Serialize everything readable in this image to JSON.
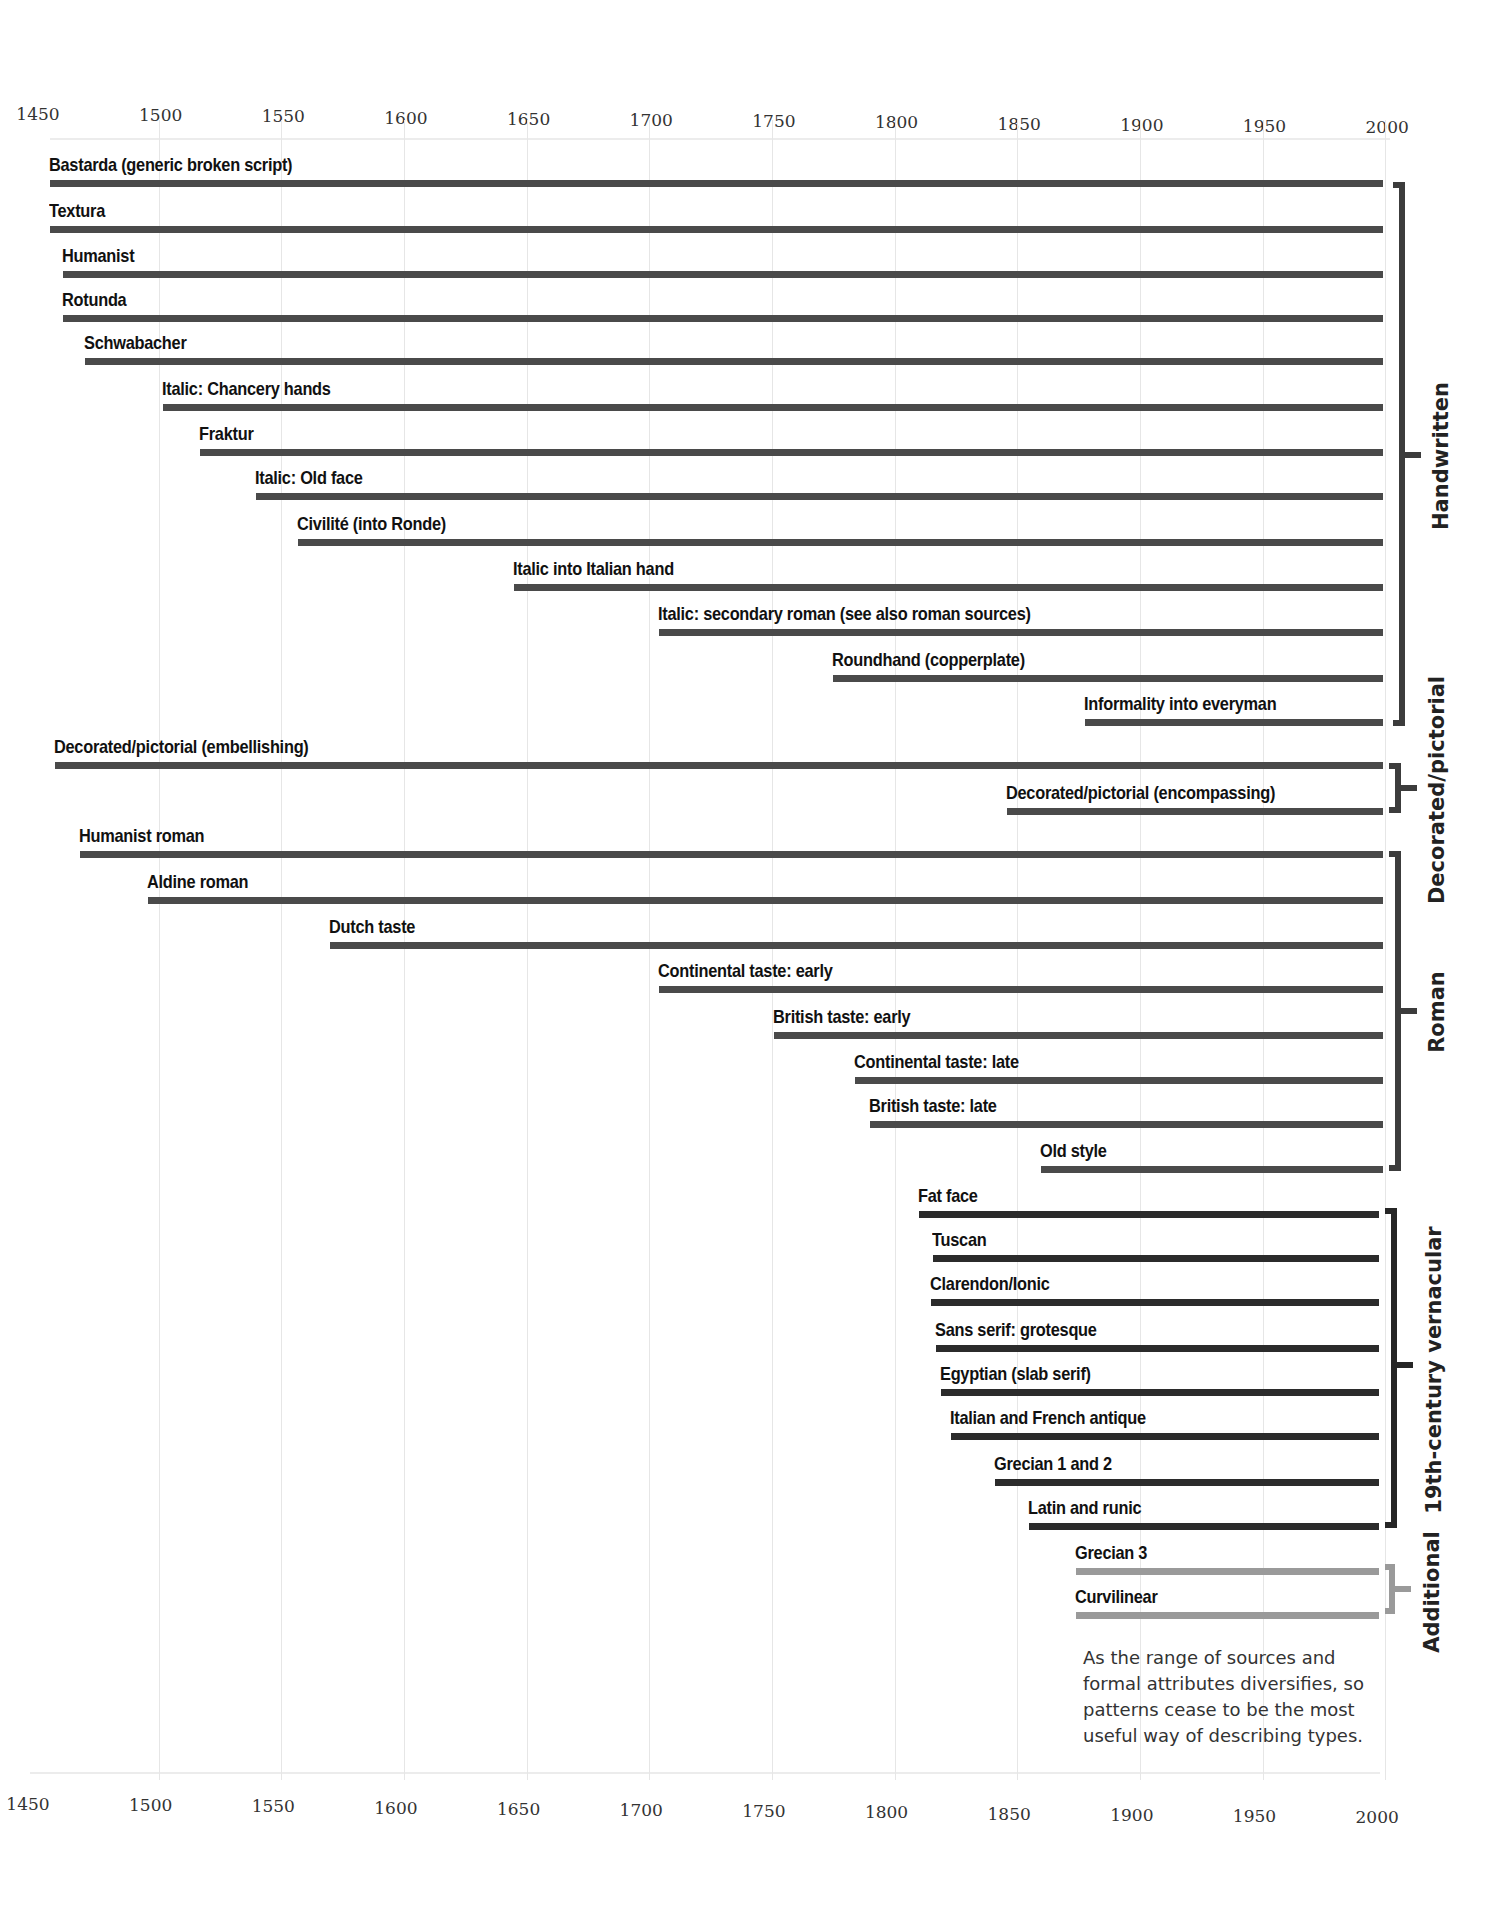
{
  "chart_data": {
    "type": "bar",
    "subtype": "timeline (horizontal range bars)",
    "title": "",
    "xlabel": "",
    "ylabel": "",
    "xlim": [
      1450,
      2000
    ],
    "x_ticks": [
      1450,
      1500,
      1550,
      1600,
      1650,
      1700,
      1750,
      1800,
      1850,
      1900,
      1950,
      2000
    ],
    "grid": true,
    "axis_position": "top and bottom",
    "groups": [
      {
        "name": "Handwritten",
        "color": "#4a4a4a",
        "items": [
          {
            "label": "Bastarda (generic broken script)",
            "start": 1455,
            "end": 2000
          },
          {
            "label": "Textura",
            "start": 1455,
            "end": 2000
          },
          {
            "label": "Humanist",
            "start": 1460,
            "end": 2000
          },
          {
            "label": "Rotunda",
            "start": 1460,
            "end": 2000
          },
          {
            "label": "Schwabacher",
            "start": 1469,
            "end": 2000
          },
          {
            "label": "Italic: Chancery hands",
            "start": 1501,
            "end": 2000
          },
          {
            "label": "Fraktur",
            "start": 1516,
            "end": 2000
          },
          {
            "label": "Italic: Old face",
            "start": 1539,
            "end": 2000
          },
          {
            "label": "Civilité (into Ronde)",
            "start": 1556,
            "end": 2000
          },
          {
            "label": "Italic into Italian hand",
            "start": 1644,
            "end": 2000
          },
          {
            "label": "Italic: secondary roman (see also roman sources)",
            "start": 1703,
            "end": 2000
          },
          {
            "label": "Roundhand (copperplate)",
            "start": 1774,
            "end": 2000
          },
          {
            "label": "Informality into everyman",
            "start": 1877,
            "end": 2000
          }
        ]
      },
      {
        "name": "Decorated/pictorial",
        "color": "#4a4a4a",
        "items": [
          {
            "label": "Decorated/pictorial (embellishing)",
            "start": 1457,
            "end": 2000
          },
          {
            "label": "Decorated/pictorial (encompassing)",
            "start": 1845,
            "end": 2000
          }
        ]
      },
      {
        "name": "Roman",
        "color": "#3a3a3a",
        "items": [
          {
            "label": "Humanist roman",
            "start": 1467,
            "end": 2000
          },
          {
            "label": "Aldine roman",
            "start": 1495,
            "end": 2000
          },
          {
            "label": "Dutch taste",
            "start": 1569,
            "end": 2000
          },
          {
            "label": "Continental taste: early",
            "start": 1703,
            "end": 2000
          },
          {
            "label": "British taste: early",
            "start": 1750,
            "end": 2000
          },
          {
            "label": "Continental taste: late",
            "start": 1783,
            "end": 2000
          },
          {
            "label": "British taste: late",
            "start": 1789,
            "end": 2000
          },
          {
            "label": "Old style",
            "start": 1859,
            "end": 2000
          }
        ]
      },
      {
        "name": "19th-century vernacular",
        "color": "#262626",
        "items": [
          {
            "label": "Fat face",
            "start": 1809,
            "end": 2000
          },
          {
            "label": "Tuscan",
            "start": 1815,
            "end": 2000
          },
          {
            "label": "Clarendon/Ionic",
            "start": 1814,
            "end": 2000
          },
          {
            "label": "Sans serif: grotesque",
            "start": 1816,
            "end": 2000
          },
          {
            "label": "Egyptian (slab serif)",
            "start": 1818,
            "end": 2000
          },
          {
            "label": "Italian and French antique",
            "start": 1822,
            "end": 2000
          },
          {
            "label": "Grecian 1 and 2",
            "start": 1840,
            "end": 2000
          },
          {
            "label": "Latin and runic",
            "start": 1854,
            "end": 2000
          }
        ]
      },
      {
        "name": "Additional",
        "color": "#9a9a9a",
        "items": [
          {
            "label": "Grecian 3",
            "start": 1873,
            "end": 2000
          },
          {
            "label": "Curvilinear",
            "start": 1873,
            "end": 2000
          }
        ]
      }
    ],
    "annotations": [
      "As the range of sources and formal attributes diversifies, so patterns cease to be the most useful way of describing types."
    ]
  },
  "axis": {
    "ticks": [
      "1450",
      "1500",
      "1550",
      "1600",
      "1650",
      "1700",
      "1750",
      "1800",
      "1850",
      "1900",
      "1950",
      "2000"
    ]
  },
  "groups": {
    "handwritten": "Handwritten",
    "decorated": "Decorated/pictorial",
    "roman": "Roman",
    "vernacular": "19th-century vernacular",
    "additional": "Additional"
  },
  "rows": [
    "Bastarda (generic broken script)",
    "Textura",
    "Humanist",
    "Rotunda",
    "Schwabacher",
    "Italic: Chancery hands",
    "Fraktur",
    "Italic: Old face",
    "Civilité (into Ronde)",
    "Italic into Italian hand",
    "Italic: secondary roman (see also roman sources)",
    "Roundhand (copperplate)",
    "Informality into everyman",
    "Decorated/pictorial (embellishing)",
    "Decorated/pictorial (encompassing)",
    "Humanist roman",
    "Aldine roman",
    "Dutch taste",
    "Continental taste: early",
    "British taste: early",
    "Continental taste: late",
    "British taste: late",
    "Old style",
    "Fat face",
    "Tuscan",
    "Clarendon/Ionic",
    "Sans serif: grotesque",
    "Egyptian (slab serif)",
    "Italian and French antique",
    "Grecian 1 and 2",
    "Latin and runic",
    "Grecian 3",
    "Curvilinear"
  ],
  "note": "As the range of sources and formal attributes diversifies, so patterns cease to be the most useful way of describing types."
}
